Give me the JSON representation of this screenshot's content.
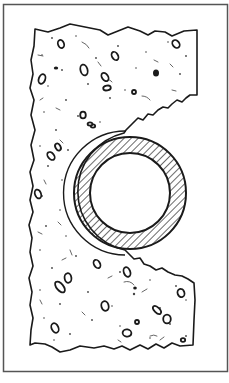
{
  "figure": {
    "elements": [
      {
        "name": "frame",
        "label": "Figure border"
      },
      {
        "name": "concrete-block",
        "label": "Concrete / masonry with aggregate"
      },
      {
        "name": "sleeve",
        "label": "Sleeve / gap around pipe"
      },
      {
        "name": "pipe-wall",
        "label": "Pipe wall (hatched section)"
      },
      {
        "name": "pipe-bore",
        "label": "Pipe bore (hollow)"
      }
    ],
    "colors": {
      "ink": "#1a1a1a",
      "frame": "#555555",
      "background": "#ffffff"
    }
  }
}
